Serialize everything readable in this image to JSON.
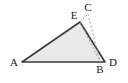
{
  "figure": {
    "canvas": {
      "width": 128,
      "height": 83,
      "background": "#ffffff"
    },
    "style": {
      "fill_color": "#e9e9e9",
      "stroke_color": "#3a3a3a",
      "stroke_width": 1.6,
      "dashed_color": "#9a9a9a",
      "dashed_width": 0.9,
      "dash_pattern": "2,2",
      "label_color": "#222222",
      "label_font_size": 11
    },
    "points": {
      "A": {
        "label": "A",
        "x": 22,
        "y": 62,
        "label_x": 14,
        "label_y": 66
      },
      "B": {
        "label": "B",
        "x": 100,
        "y": 62,
        "label_x": 100,
        "label_y": 73
      },
      "C": {
        "label": "C",
        "x": 88,
        "y": 14,
        "label_x": 88,
        "label_y": 11
      },
      "D": {
        "label": "D",
        "x": 105,
        "y": 62,
        "label_x": 113,
        "label_y": 66
      },
      "E": {
        "label": "E",
        "x": 80,
        "y": 22,
        "label_x": 74,
        "label_y": 19
      }
    },
    "shapes": {
      "triangle": {
        "name": "triangle-AED",
        "vertices": "A,E,D",
        "points_attr": "22,62 80,22 105,62"
      },
      "dashed_segment": {
        "name": "segment-CB",
        "from": "C",
        "to": "B",
        "x1": 88,
        "y1": 14,
        "x2": 100,
        "y2": 62
      },
      "dashed_segment_2": {
        "name": "segment-EB",
        "from": "E",
        "to": "B",
        "x1": 80,
        "y1": 22,
        "x2": 100,
        "y2": 62
      }
    },
    "labels_order": [
      "A",
      "E",
      "C",
      "B",
      "D"
    ]
  }
}
